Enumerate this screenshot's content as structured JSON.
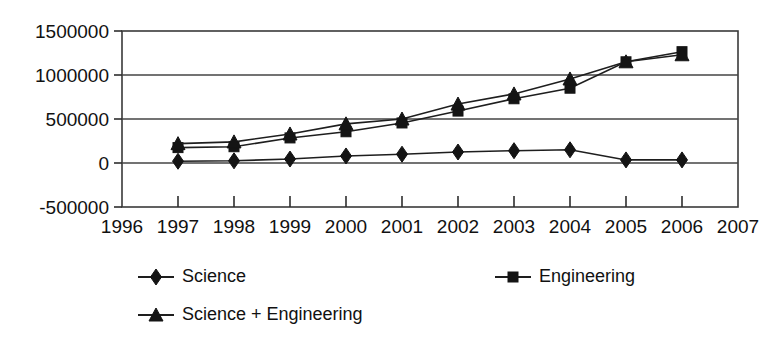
{
  "chart_data": {
    "type": "line",
    "title": "",
    "subtitle": "",
    "xlabel": "",
    "ylabel": "",
    "x": [
      1997,
      1998,
      1999,
      2000,
      2001,
      2002,
      2003,
      2004,
      2005,
      2006
    ],
    "xlim": [
      1996,
      2007
    ],
    "ylim": [
      -500000,
      1500000
    ],
    "x_tick_labels": [
      "1996",
      "1997",
      "1998",
      "1999",
      "2000",
      "2001",
      "2002",
      "2003",
      "2004",
      "2005",
      "2006",
      "2007"
    ],
    "x_ticks": [
      1996,
      1997,
      1998,
      1999,
      2000,
      2001,
      2002,
      2003,
      2004,
      2005,
      2006,
      2007
    ],
    "y_tick_labels": [
      "1500000",
      "1000000",
      "500000",
      "0",
      "-500000"
    ],
    "y_ticks": [
      1500000,
      1000000,
      500000,
      0,
      -500000
    ],
    "grid": "horizontal",
    "legend_position": "bottom",
    "series": [
      {
        "name": "Science",
        "marker": "diamond",
        "color": "#141414",
        "values": [
          20000,
          25000,
          45000,
          80000,
          100000,
          125000,
          140000,
          150000,
          35000,
          35000
        ]
      },
      {
        "name": "Engineering",
        "marker": "square",
        "color": "#141414",
        "values": [
          175000,
          185000,
          285000,
          355000,
          455000,
          590000,
          730000,
          850000,
          1150000,
          1265000
        ]
      },
      {
        "name": "Science + Engineering",
        "marker": "triangle",
        "color": "#141414",
        "values": [
          220000,
          240000,
          330000,
          445000,
          500000,
          670000,
          785000,
          955000,
          1150000,
          1230000
        ]
      }
    ]
  },
  "legend": {
    "entries": [
      {
        "label": "Science",
        "marker": "diamond"
      },
      {
        "label": "Engineering",
        "marker": "square"
      },
      {
        "label": "Science + Engineering",
        "marker": "triangle"
      }
    ]
  },
  "colors": {
    "ink": "#141414",
    "grid": "#444444",
    "frame": "#3a3a3a",
    "background": "#ffffff"
  }
}
